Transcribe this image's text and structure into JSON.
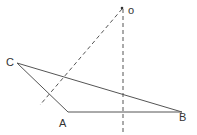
{
  "diagram": {
    "colors": {
      "line": "#555555",
      "text": "#333333",
      "background": "#ffffff"
    },
    "points": {
      "O": {
        "label": "o",
        "x": 122,
        "y": 9
      },
      "C": {
        "label": "C",
        "x": 17,
        "y": 63
      },
      "A": {
        "label": "A",
        "x": 68,
        "y": 112
      },
      "B": {
        "label": "B",
        "x": 182,
        "y": 112
      }
    },
    "labels": {
      "o": "o",
      "c": "C",
      "a": "A",
      "b": "B"
    }
  }
}
